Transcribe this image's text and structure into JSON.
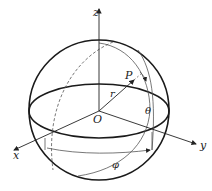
{
  "diagram": {
    "labels": {
      "z_axis": "z",
      "x_axis": "x",
      "y_axis": "y",
      "origin": "O",
      "point": "P",
      "radius": "r",
      "polar_angle": "θ",
      "azimuth_angle": "φ"
    },
    "colors": {
      "stroke": "#1a1a1a",
      "thin_stroke": "#555555",
      "background": "#ffffff"
    }
  }
}
